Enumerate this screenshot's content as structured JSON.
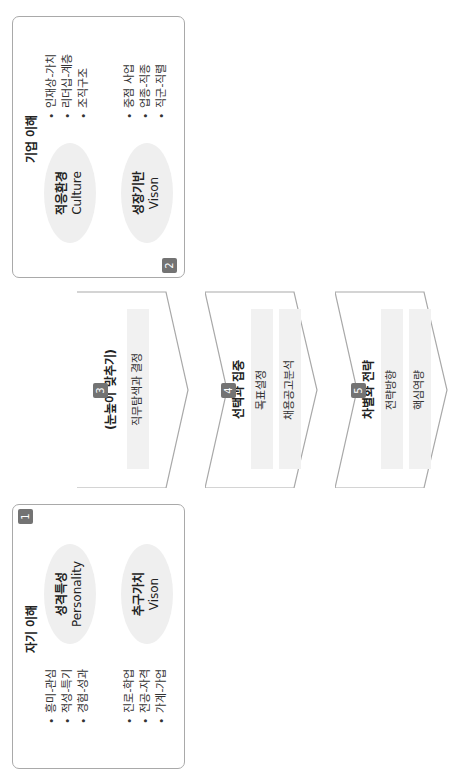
{
  "diagram": {
    "orientation": "rotated-90-ccw",
    "colors": {
      "border": "#a9a9a9",
      "badge": "#737373",
      "fill": "#efefef"
    },
    "self_understanding": {
      "badge": "1",
      "title": "자기 이해",
      "ellipses": [
        {
          "ko": "성격특성",
          "en": "Personality"
        },
        {
          "ko": "추구가치",
          "en": "Vison"
        }
      ],
      "bullets_top": [
        "흥미-관심",
        "적성-특기",
        "경험-성과"
      ],
      "bullets_bottom": [
        "진로-학업",
        "전공-자격",
        "가계-가업"
      ]
    },
    "company_understanding": {
      "badge": "2",
      "title": "기업 이해",
      "ellipses": [
        {
          "ko": "적응환경",
          "en": "Culture"
        },
        {
          "ko": "성장기반",
          "en": "Vison"
        }
      ],
      "bullets_top": [
        "인재상-가치",
        "리더십-계층",
        "조직구조"
      ],
      "bullets_bottom": [
        "중점 사업",
        "업종-직종",
        "직군-직렬"
      ]
    },
    "steps": [
      {
        "badge": "3",
        "title": "(눈높이 맞추기)",
        "items": [
          "직무탐색과 결정"
        ]
      },
      {
        "badge": "4",
        "title": "선택과 집중",
        "items": [
          "목표설정",
          "채용공고분석"
        ]
      },
      {
        "badge": "5",
        "title": "차별화 전략",
        "items": [
          "전략방향",
          "핵심역량"
        ]
      }
    ]
  }
}
